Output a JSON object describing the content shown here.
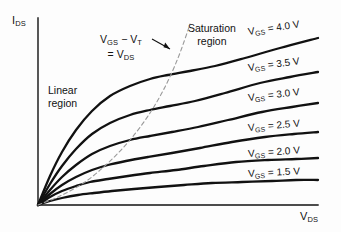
{
  "figure": {
    "background_color": "#fdfdfd",
    "ink_color": "#111111",
    "dash_color": "#9a9a9a"
  },
  "axes": {
    "y_label_main": "I",
    "y_label_sub": "DS",
    "x_label_main": "V",
    "x_label_sub": "DS",
    "origin": {
      "x": 38,
      "y": 205
    },
    "y_axis_top": 18,
    "x_axis_right": 318,
    "grid": false
  },
  "annotations": {
    "linear_region": {
      "line1": "Linear",
      "line2": "region",
      "x": 48,
      "y": 84
    },
    "saturation_region": {
      "line1": "Saturation",
      "line2": "region",
      "x": 188,
      "y": 22
    },
    "boundary_note": {
      "line1_main_a": "V",
      "line1_sub_a": "GS",
      "line1_mid": " − V",
      "line1_sub_b": "T",
      "line2_prefix": "= V",
      "line2_sub": "DS",
      "x": 100,
      "y": 33
    }
  },
  "chart_data": {
    "type": "line",
    "title": "",
    "xlabel": "V_DS",
    "ylabel": "I_DS",
    "legend_position": "inline-right",
    "grid": false,
    "xlim": [
      0,
      1
    ],
    "ylim": [
      0,
      1
    ],
    "boundary_curve": {
      "name": "V_GS - V_T = V_DS",
      "style": "dashed",
      "color": "#9a9a9a",
      "path_points": [
        [
          38,
          205
        ],
        [
          60,
          196
        ],
        [
          85,
          182
        ],
        [
          108,
          163
        ],
        [
          130,
          140
        ],
        [
          150,
          113
        ],
        [
          166,
          85
        ],
        [
          178,
          58
        ],
        [
          186,
          36
        ],
        [
          190,
          24
        ]
      ]
    },
    "series": [
      {
        "name": "V_GS = 4.0 V",
        "vgs_volts": 4.0,
        "label": "V_GS = 4.0 V",
        "label_rotation_deg": -8.5,
        "label_x": 248,
        "label_y": 26,
        "knee": [
          168,
          76
        ],
        "right_endpoint": [
          318,
          38
        ],
        "points": [
          [
            38,
            205
          ],
          [
            50,
            176
          ],
          [
            62,
            152
          ],
          [
            76,
            130
          ],
          [
            92,
            111
          ],
          [
            110,
            96
          ],
          [
            130,
            86
          ],
          [
            150,
            79
          ],
          [
            168,
            75
          ],
          [
            190,
            71
          ],
          [
            215,
            66
          ],
          [
            245,
            58
          ],
          [
            280,
            48
          ],
          [
            318,
            38
          ]
        ]
      },
      {
        "name": "V_GS = 3.5 V",
        "vgs_volts": 3.5,
        "label": "V_GS = 3.5 V",
        "label_rotation_deg": -7.5,
        "label_x": 248,
        "label_y": 62,
        "knee": [
          150,
          111
        ],
        "right_endpoint": [
          318,
          72
        ],
        "points": [
          [
            38,
            205
          ],
          [
            50,
            184
          ],
          [
            62,
            166
          ],
          [
            76,
            149
          ],
          [
            92,
            134
          ],
          [
            110,
            123
          ],
          [
            130,
            115
          ],
          [
            150,
            110
          ],
          [
            170,
            106
          ],
          [
            195,
            101
          ],
          [
            225,
            93
          ],
          [
            260,
            83
          ],
          [
            290,
            77
          ],
          [
            318,
            72
          ]
        ]
      },
      {
        "name": "V_GS = 3.0 V",
        "vgs_volts": 3.0,
        "label": "V_GS = 3.0 V",
        "label_rotation_deg": -6.5,
        "label_x": 248,
        "label_y": 92,
        "knee": [
          130,
          140
        ],
        "right_endpoint": [
          318,
          103
        ],
        "points": [
          [
            38,
            205
          ],
          [
            50,
            190
          ],
          [
            62,
            177
          ],
          [
            76,
            165
          ],
          [
            92,
            154
          ],
          [
            110,
            146
          ],
          [
            130,
            140
          ],
          [
            150,
            136
          ],
          [
            172,
            132
          ],
          [
            198,
            127
          ],
          [
            228,
            120
          ],
          [
            262,
            112
          ],
          [
            292,
            107
          ],
          [
            318,
            103
          ]
        ]
      },
      {
        "name": "V_GS = 2.5 V",
        "vgs_volts": 2.5,
        "label": "V_GS = 2.5 V",
        "label_rotation_deg": -5,
        "label_x": 248,
        "label_y": 122,
        "knee": [
          108,
          164
        ],
        "right_endpoint": [
          318,
          132
        ],
        "points": [
          [
            38,
            205
          ],
          [
            50,
            194
          ],
          [
            62,
            185
          ],
          [
            76,
            177
          ],
          [
            92,
            170
          ],
          [
            108,
            165
          ],
          [
            126,
            161
          ],
          [
            148,
            157
          ],
          [
            172,
            153
          ],
          [
            200,
            148
          ],
          [
            232,
            142
          ],
          [
            265,
            137
          ],
          [
            294,
            134
          ],
          [
            318,
            132
          ]
        ]
      },
      {
        "name": "V_GS = 2.0 V",
        "vgs_volts": 2.0,
        "label": "V_GS = 2.0 V",
        "label_rotation_deg": -4,
        "label_x": 248,
        "label_y": 148,
        "knee": [
          86,
          182
        ],
        "right_endpoint": [
          318,
          158
        ],
        "points": [
          [
            38,
            205
          ],
          [
            50,
            197
          ],
          [
            62,
            191
          ],
          [
            76,
            186
          ],
          [
            90,
            182
          ],
          [
            108,
            179
          ],
          [
            128,
            176
          ],
          [
            150,
            173
          ],
          [
            176,
            170
          ],
          [
            204,
            166
          ],
          [
            236,
            162
          ],
          [
            268,
            160
          ],
          [
            296,
            159
          ],
          [
            318,
            158
          ]
        ]
      },
      {
        "name": "V_GS = 1.5 V",
        "vgs_volts": 1.5,
        "label": "V_GS = 1.5 V",
        "label_rotation_deg": -3,
        "label_x": 248,
        "label_y": 168,
        "knee": [
          62,
          196
        ],
        "right_endpoint": [
          318,
          180
        ],
        "points": [
          [
            38,
            205
          ],
          [
            50,
            201
          ],
          [
            62,
            198
          ],
          [
            78,
            195
          ],
          [
            94,
            193
          ],
          [
            112,
            191
          ],
          [
            134,
            189
          ],
          [
            158,
            187
          ],
          [
            184,
            185
          ],
          [
            212,
            183
          ],
          [
            242,
            182
          ],
          [
            272,
            181
          ],
          [
            296,
            180
          ],
          [
            318,
            180
          ]
        ]
      }
    ]
  }
}
